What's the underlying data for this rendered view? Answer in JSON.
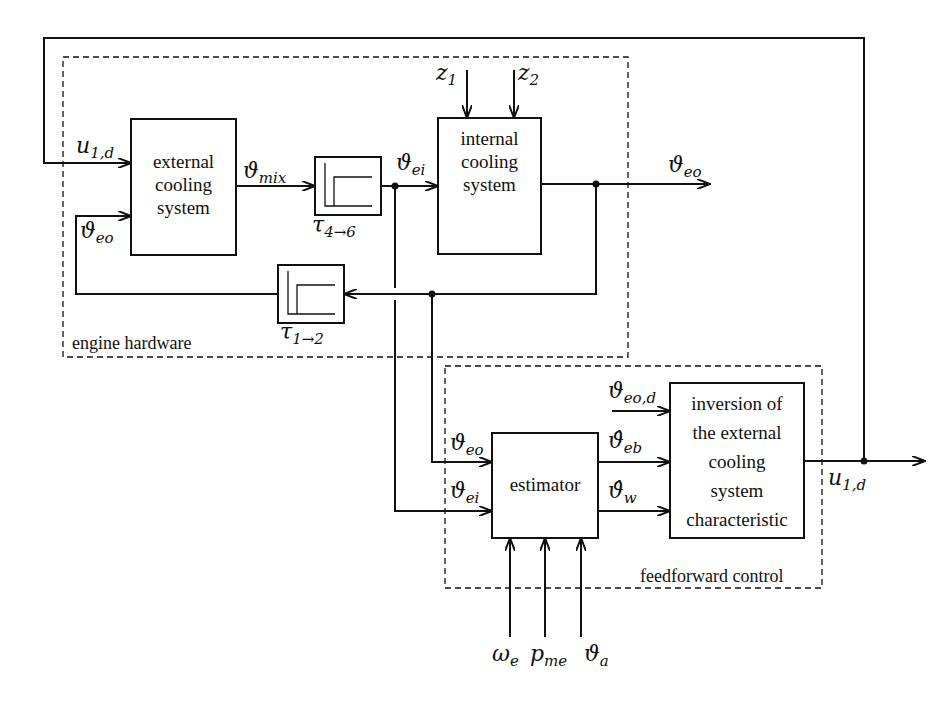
{
  "diagram": {
    "type": "block-diagram",
    "groups": {
      "engine_hardware": "engine hardware",
      "feedforward_control": "feedforward control"
    },
    "blocks": {
      "external_cooling": [
        "external",
        "cooling",
        "system"
      ],
      "internal_cooling": [
        "internal",
        "cooling",
        "system"
      ],
      "estimator": "estimator",
      "inversion": [
        "inversion of",
        "the external",
        "cooling",
        "system",
        "characteristic"
      ],
      "delay_forward": {
        "label": "τ",
        "sub": "4→6"
      },
      "delay_feedback": {
        "label": "τ",
        "sub": "1→2"
      }
    },
    "signals": {
      "u1d_in": {
        "base": "u",
        "sub": "1,d"
      },
      "theta_eo_in": {
        "base": "ϑ",
        "sub": "eo"
      },
      "theta_mix": {
        "base": "ϑ",
        "sub": "mix"
      },
      "theta_ei": {
        "base": "ϑ",
        "sub": "ei"
      },
      "z1": {
        "base": "z",
        "sub": "1"
      },
      "z2": {
        "base": "z",
        "sub": "2"
      },
      "theta_eo_out": {
        "base": "ϑ",
        "sub": "eo"
      },
      "est_theta_eo": {
        "base": "ϑ",
        "sub": "eo"
      },
      "est_theta_ei": {
        "base": "ϑ",
        "sub": "ei"
      },
      "theta_eo_d": {
        "base": "ϑ",
        "sub": "eo,d"
      },
      "theta_eb_hat": {
        "base": "ϑ̂",
        "sub": "eb"
      },
      "theta_w_hat": {
        "base": "ϑ̂",
        "sub": "w"
      },
      "u1d_out": {
        "base": "u",
        "sub": "1,d"
      },
      "omega_e": {
        "base": "ω",
        "sub": "e"
      },
      "p_me": {
        "base": "p",
        "sub": "me"
      },
      "theta_a": {
        "base": "ϑ",
        "sub": "a"
      }
    }
  }
}
